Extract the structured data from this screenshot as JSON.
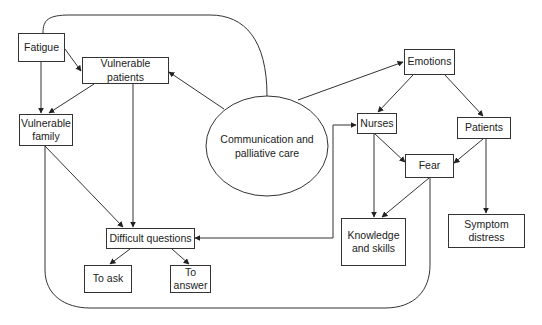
{
  "diagram": {
    "center": {
      "label": "Communication and palliative care"
    },
    "nodes": {
      "fatigue": "Fatigue",
      "vulnerable_patients": "Vulnerable patients",
      "vulnerable_family": "Vulnerable family",
      "difficult_questions": "Difficult questions",
      "to_ask": "To ask",
      "to_answer": "To answer",
      "emotions": "Emotions",
      "nurses": "Nurses",
      "patients": "Patients",
      "fear": "Fear",
      "knowledge_and_skills": "Knowledge and skills",
      "symptom_distress": "Symptom distress"
    },
    "edges": [
      {
        "from": "Communication and palliative care",
        "to": "Vulnerable patients"
      },
      {
        "from": "Communication and palliative care",
        "to": "Fatigue",
        "style": "curved, no arrow"
      },
      {
        "from": "Communication and palliative care",
        "to": "Emotions"
      },
      {
        "from": "Fatigue",
        "to": "Vulnerable patients"
      },
      {
        "from": "Fatigue",
        "to": "Vulnerable family"
      },
      {
        "from": "Vulnerable patients",
        "to": "Vulnerable family"
      },
      {
        "from": "Vulnerable patients",
        "to": "Difficult questions"
      },
      {
        "from": "Vulnerable family",
        "to": "Difficult questions"
      },
      {
        "from": "Difficult questions",
        "to": "To ask"
      },
      {
        "from": "Difficult questions",
        "to": "To answer"
      },
      {
        "from": "Difficult questions",
        "to": "Nurses",
        "style": "bidirectional elbow"
      },
      {
        "from": "Emotions",
        "to": "Nurses"
      },
      {
        "from": "Emotions",
        "to": "Patients"
      },
      {
        "from": "Nurses",
        "to": "Fear"
      },
      {
        "from": "Nurses",
        "to": "Knowledge and skills"
      },
      {
        "from": "Patients",
        "to": "Fear"
      },
      {
        "from": "Patients",
        "to": "Symptom distress"
      },
      {
        "from": "Fear",
        "to": "Knowledge and skills"
      },
      {
        "from": "Fear",
        "to": "Vulnerable family",
        "style": "curved loop, no arrow"
      }
    ]
  }
}
